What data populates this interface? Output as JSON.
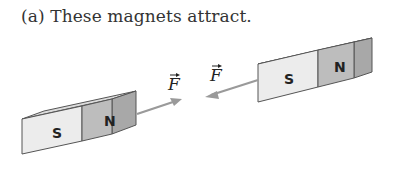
{
  "caption": "(a) These magnets attract.",
  "magnets": [
    {
      "name": "left-magnet",
      "left_pole": "S",
      "right_pole": "N"
    },
    {
      "name": "right-magnet",
      "left_pole": "S",
      "right_pole": "N"
    }
  ],
  "forces": [
    {
      "label": "F",
      "direction": "right",
      "on": "left-magnet"
    },
    {
      "label": "F",
      "direction": "left",
      "on": "right-magnet"
    }
  ],
  "colors": {
    "south_face": "#e6e6e6",
    "north_face": "#bdbdbd",
    "top_face": "#d2d2d2",
    "arrow": "#9a9a9a",
    "outline": "#555555"
  }
}
